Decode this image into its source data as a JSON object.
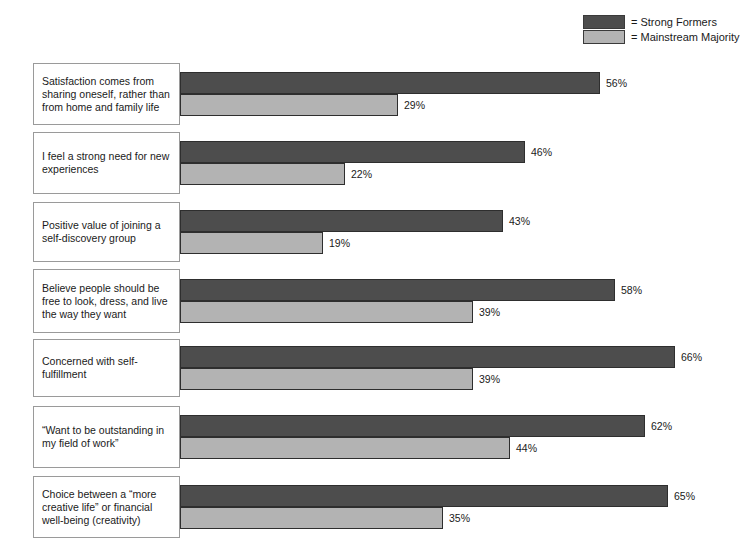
{
  "legend": {
    "items": [
      {
        "label": "= Strong Formers",
        "series": "Strong Formers",
        "color": "#4d4d4d"
      },
      {
        "label": "= Mainstream Majority",
        "series": "Mainstream Majority",
        "color": "#b3b3b3"
      }
    ]
  },
  "chart_data": {
    "type": "bar",
    "orientation": "horizontal",
    "title": "",
    "xlabel": "",
    "ylabel": "",
    "xlim": [
      0,
      70
    ],
    "grid": false,
    "legend_position": "top-right",
    "value_suffix": "%",
    "categories": [
      "Satisfaction comes from sharing oneself, rather than from home and family life",
      "I feel a strong need for new experiences",
      "Positive value of joining a self-discovery group",
      "Believe people should be free to look, dress, and live the way they want",
      "Concerned with self-fulfillment",
      "“Want to be outstanding in my field of work”",
      "Choice between a “more creative life” or financial well-being (creativity)"
    ],
    "category_lines": [
      [
        "Satisfaction comes from",
        "sharing oneself, rather than",
        "from home and family life"
      ],
      [
        "I feel a strong need for new",
        "experiences"
      ],
      [
        "Positive value of joining a",
        "self-discovery group"
      ],
      [
        "Believe people should be",
        "free to look, dress, and live",
        "the way they want"
      ],
      [
        "Concerned with self-fulfillment"
      ],
      [
        "“Want to be outstanding in",
        "my field of work”"
      ],
      [
        "Choice between a “more",
        "creative life” or financial",
        "well-being (creativity)"
      ]
    ],
    "series": [
      {
        "name": "Strong Formers",
        "color": "#4d4d4d",
        "values": [
          56,
          46,
          43,
          58,
          66,
          62,
          65
        ],
        "labels": [
          "56%",
          "46%",
          "43%",
          "58%",
          "66%",
          "62%",
          "65%"
        ]
      },
      {
        "name": "Mainstream Majority",
        "color": "#b3b3b3",
        "values": [
          29,
          22,
          19,
          39,
          39,
          44,
          35
        ],
        "labels": [
          "29%",
          "22%",
          "19%",
          "39%",
          "39%",
          "44%",
          "35%"
        ]
      }
    ]
  },
  "layout": {
    "group_tops": [
      63,
      132,
      202,
      269,
      339,
      406,
      476
    ],
    "group_heights": [
      62,
      62,
      60,
      64,
      58,
      62,
      62
    ]
  }
}
